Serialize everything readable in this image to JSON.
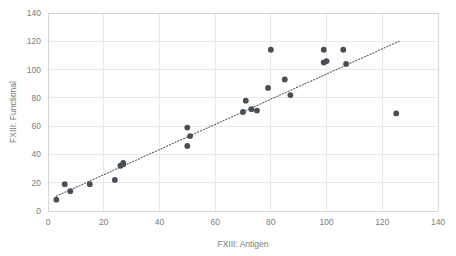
{
  "chart_data": {
    "type": "scatter",
    "title": "",
    "xlabel": "FXIII: Antigen",
    "ylabel": "FXIII: Functional",
    "xlim": [
      0,
      140
    ],
    "ylim": [
      0,
      140
    ],
    "xticks": [
      0,
      20,
      40,
      60,
      80,
      100,
      120,
      140
    ],
    "yticks": [
      0,
      20,
      40,
      60,
      80,
      100,
      120,
      140
    ],
    "xtick_labels": [
      "0",
      "20",
      "40",
      "60",
      "80",
      "100",
      "120",
      "140"
    ],
    "ytick_labels": [
      "0",
      "20",
      "40",
      "60",
      "80",
      "100",
      "120",
      "140"
    ],
    "grid": true,
    "legend": false,
    "marker_color": "#494d55",
    "grid_color": "#e4e4e4",
    "text_color": "#7b7b7b",
    "points": [
      {
        "x": 3,
        "y": 8
      },
      {
        "x": 6,
        "y": 19
      },
      {
        "x": 8,
        "y": 14
      },
      {
        "x": 15,
        "y": 19
      },
      {
        "x": 24,
        "y": 22
      },
      {
        "x": 26,
        "y": 32
      },
      {
        "x": 27,
        "y": 33
      },
      {
        "x": 27,
        "y": 34
      },
      {
        "x": 50,
        "y": 59
      },
      {
        "x": 50,
        "y": 46
      },
      {
        "x": 51,
        "y": 53
      },
      {
        "x": 70,
        "y": 70
      },
      {
        "x": 71,
        "y": 78
      },
      {
        "x": 73,
        "y": 72
      },
      {
        "x": 75,
        "y": 71
      },
      {
        "x": 79,
        "y": 87
      },
      {
        "x": 80,
        "y": 114
      },
      {
        "x": 85,
        "y": 93
      },
      {
        "x": 87,
        "y": 82
      },
      {
        "x": 99,
        "y": 114
      },
      {
        "x": 99,
        "y": 105
      },
      {
        "x": 100,
        "y": 106
      },
      {
        "x": 106,
        "y": 114
      },
      {
        "x": 107,
        "y": 104
      },
      {
        "x": 125,
        "y": 69
      }
    ],
    "trendline": {
      "type": "linear",
      "dashed": true,
      "x_start": 3,
      "y_start": 10.5,
      "x_end": 126,
      "y_end": 120
    }
  }
}
